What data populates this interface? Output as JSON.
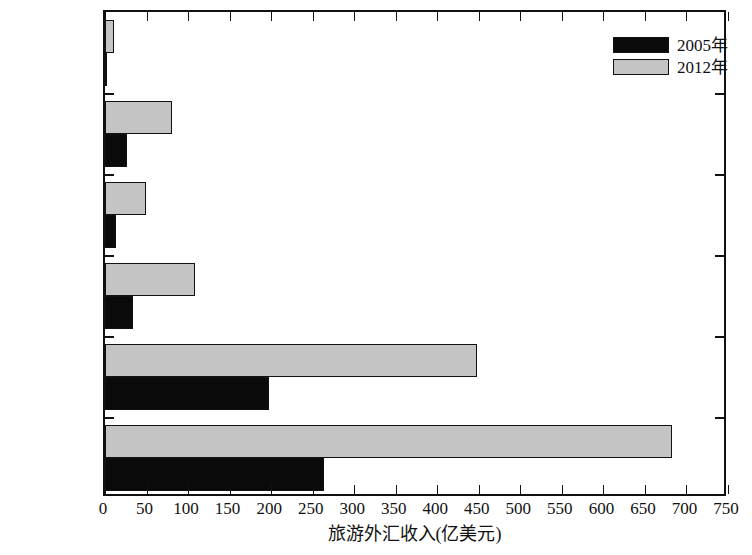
{
  "chart_data": {
    "type": "bar",
    "orientation": "horizontal",
    "title": "",
    "xlabel": "旅游外汇收入(亿美元)",
    "ylabel": "",
    "categories": [
      "中国冰川区",
      "西部地区",
      "东北地区",
      "中部地区",
      "东部地区",
      "全国"
    ],
    "series": [
      {
        "name": "2005年",
        "color": "#0a0a0a",
        "values": [
          2,
          26,
          13,
          34,
          197,
          264
        ]
      },
      {
        "name": "2012年",
        "color": "#c4c4c4",
        "values": [
          11,
          81,
          49,
          108,
          448,
          682
        ]
      }
    ],
    "xlim": [
      0,
      750
    ],
    "xticks": [
      0,
      50,
      100,
      150,
      200,
      250,
      300,
      350,
      400,
      450,
      500,
      550,
      600,
      650,
      700,
      750
    ],
    "xtick_labels": [
      "0",
      "50",
      "100",
      "150",
      "200",
      "250",
      "300",
      "350",
      "400",
      "450",
      "500",
      "550",
      "600",
      "650",
      "700",
      "750"
    ],
    "grid": false,
    "legend_position": "top-right",
    "legend_entries": [
      "2005年",
      "2012年"
    ]
  },
  "axis": {
    "x_title": "旅游外汇收入(亿美元)"
  },
  "legend": {
    "items": [
      {
        "label": "2005年"
      },
      {
        "label": "2012年"
      }
    ]
  }
}
